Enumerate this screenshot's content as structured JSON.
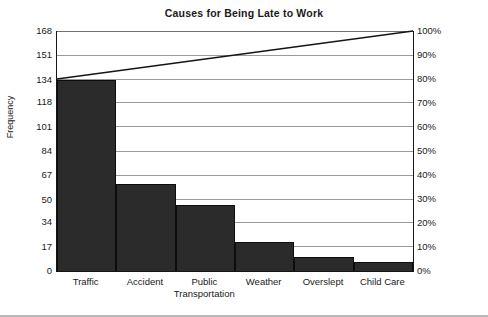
{
  "chart_data": {
    "type": "bar",
    "title": "Causes for Being Late to Work",
    "xlabel": "",
    "ylabel": "Frequency",
    "y2label": "",
    "categories": [
      "Traffic",
      "Accident",
      "Public Transportation",
      "Weather",
      "Overslept",
      "Child Care"
    ],
    "values": [
      134,
      61,
      46,
      20,
      10,
      6
    ],
    "ylim": [
      0,
      168
    ],
    "yticks": [
      0,
      17,
      34,
      50,
      67,
      84,
      101,
      118,
      134,
      151,
      168
    ],
    "y2lim": [
      0,
      100
    ],
    "y2ticks": [
      "0%",
      "10%",
      "20%",
      "30%",
      "40%",
      "50%",
      "60%",
      "70%",
      "80%",
      "90%",
      "100%"
    ],
    "y2tick_values": [
      0,
      10,
      20,
      30,
      40,
      50,
      60,
      70,
      80,
      90,
      100
    ],
    "cumulative_percent": [
      79.8,
      116.1,
      143.5,
      155.4,
      161.3,
      164.9
    ],
    "cumulative_line": {
      "start_percent": 80,
      "end_percent": 100,
      "points": [
        [
          0,
          80
        ],
        [
          100,
          100
        ]
      ]
    },
    "grid": true,
    "legend": "none",
    "bar_color": "#2b2b2b",
    "line_color": "#151515",
    "grid_color": "#9a9a9a",
    "axis_color": "#151515"
  },
  "axis": {
    "y_title": "Frequency"
  }
}
